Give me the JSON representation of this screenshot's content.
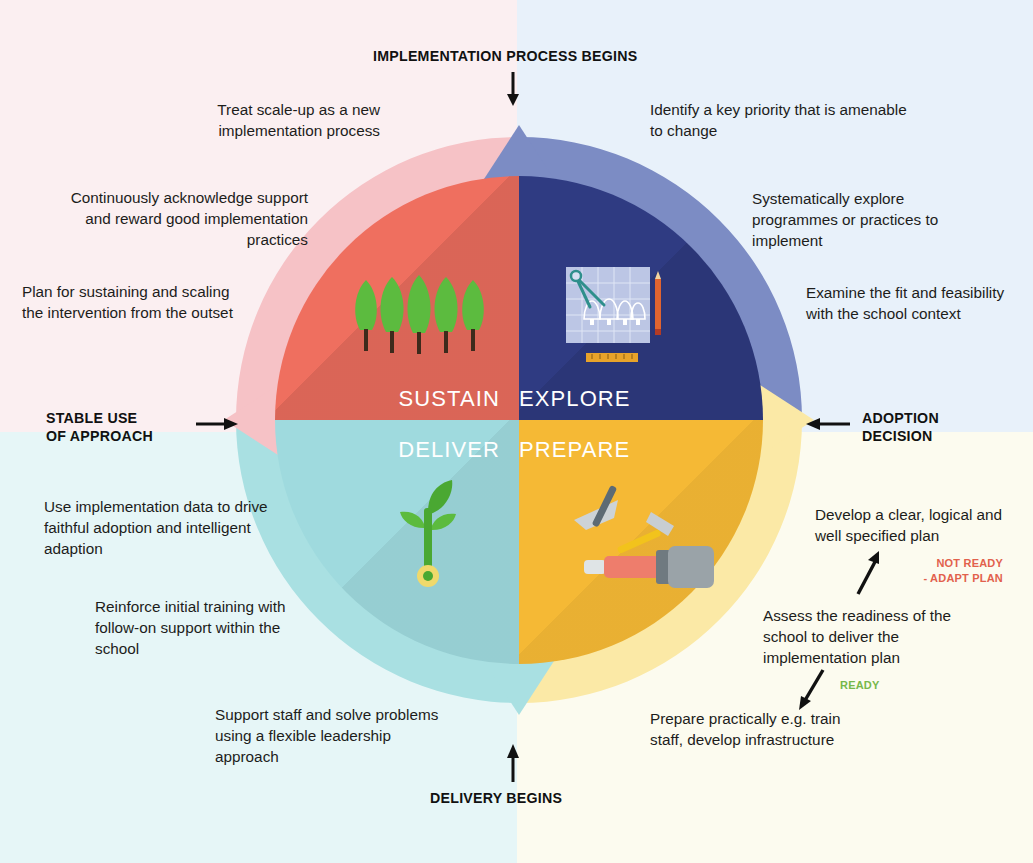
{
  "diagram": {
    "type": "cyclical-quadrant-diagram"
  },
  "colors": {
    "bg_sustain": "#fbeff1",
    "bg_explore": "#e8f1fa",
    "bg_deliver": "#e6f6f7",
    "bg_prepare": "#fcfbef",
    "ring_sustain": "#f6c2c6",
    "ring_explore": "#7c8cc4",
    "ring_deliver": "#a9e0e2",
    "ring_prepare": "#fbe9a6",
    "pie_sustain": "#ef6f5f",
    "pie_explore": "#2f3b82",
    "pie_deliver": "#9fdade",
    "pie_prepare": "#f5b935",
    "text": "#1d1d1b",
    "not_ready": "#e2614c",
    "ready": "#77b84a"
  },
  "quadrants": [
    {
      "id": "sustain",
      "label": "SUSTAIN",
      "icon": "trees-icon",
      "notes": [
        "Treat scale-up as a new\nimplementation process",
        "Continuously acknowledge\nsupport and reward good\nimplementation practices",
        "Plan for sustaining and\nscaling the intervention\nfrom the outset"
      ]
    },
    {
      "id": "explore",
      "label": "EXPLORE",
      "icon": "blueprint-icon",
      "notes": [
        "Identify a key priority that is\namenable to change",
        "Systematically explore\nprogrammes or practices\nto implement",
        "Examine the fit and\nfeasibility with the\nschool context"
      ]
    },
    {
      "id": "deliver",
      "label": "DELIVER",
      "icon": "seedling-icon",
      "notes": [
        "Use implementation data\nto drive faithful adoption\nand intelligent adaption",
        "Reinforce initial training\nwith follow-on support\nwithin the school",
        "Support staff and solve\nproblems using a flexible\nleadership approach"
      ]
    },
    {
      "id": "prepare",
      "label": "PREPARE",
      "icon": "tools-icon",
      "notes": [
        "Develop a clear, logical\nand well specified plan",
        "Assess the readiness of\nthe school to deliver the\nimplementation plan",
        "Prepare practically e.g.\ntrain staff, develop\ninfrastructure"
      ]
    }
  ],
  "notes": {
    "sustain_1": "Treat scale-up as a new implementation process",
    "sustain_2": "Continuously acknowledge support and reward good implementation practices",
    "sustain_3": "Plan for sustaining and scaling the intervention from the outset",
    "explore_1": "Identify a key priority that is amenable to change",
    "explore_2": "Systematically explore programmes or practices to implement",
    "explore_3": "Examine the fit and feasibility with the school context",
    "deliver_1": "Use implementation data to drive faithful adoption and intelligent adaption",
    "deliver_2": "Reinforce initial training with follow-on support within the school",
    "deliver_3": "Support staff and solve problems using a flexible leadership approach",
    "prepare_1": "Develop a clear, logical and well specified plan",
    "prepare_2": "Assess the readiness of the school to deliver the implementation plan",
    "prepare_3": "Prepare practically e.g. train staff, develop infrastructure"
  },
  "stage_captions": {
    "top": "IMPLEMENTATION PROCESS BEGINS",
    "right": "ADOPTION\nDECISION",
    "right_line1": "ADOPTION",
    "right_line2": "DECISION",
    "bottom": "DELIVERY BEGINS",
    "left_line1": "STABLE USE",
    "left_line2": "OF APPROACH"
  },
  "decisions": {
    "not_ready_line1": "NOT READY",
    "not_ready_line2": "- ADAPT PLAN",
    "ready": "READY"
  }
}
